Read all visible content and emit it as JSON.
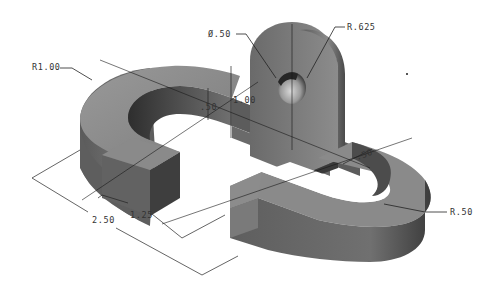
{
  "drawing": {
    "type": "isometric-cad-part",
    "colors": {
      "background": "#ffffff",
      "top_face": "#8a8a8a",
      "side_face_dark": "#4a4a4a",
      "side_face_mid": "#6a6a6a",
      "inner_face": "#3a3a3a",
      "lines": "#222222",
      "text": "#333333"
    },
    "dimensions": {
      "radius_outer_left": "R1.00",
      "hole_diameter": "Ø.50",
      "boss_radius": "R.625",
      "height_total": "1.00",
      "height_base": ".50",
      "slot_width": ".50",
      "radius_right": "R.50",
      "length_short": "1.25",
      "length_long": "2.50"
    }
  }
}
